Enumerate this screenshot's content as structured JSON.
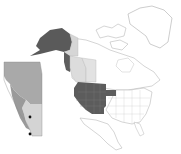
{
  "map": {
    "title": "",
    "background": "#ffffff",
    "outline_color": "#b8b8b8",
    "regions": {
      "alaska": {
        "fill": "#5a5a5a",
        "label": ""
      },
      "yukon_bc_coast": {
        "fill": "#5e5e5e",
        "label": ""
      },
      "yukon_light": {
        "fill": "#d6d6d6",
        "label": ""
      },
      "british_columbia": {
        "fill": "#dcdcdc",
        "label": ""
      },
      "alberta_light": {
        "fill": "#e2e2e2",
        "label": ""
      },
      "western_us": {
        "fill": "#5c5c5c",
        "label": ""
      },
      "nebraska_extension": {
        "fill": "#5c5c5c",
        "label": ""
      }
    },
    "inset": {
      "name": "alberta-inset",
      "fill_north": "#a9a9a9",
      "fill_south": "#d4d4d4",
      "border": "#8a8a8a",
      "points": [
        {
          "x": 30,
          "y": 117,
          "color": "#111111"
        },
        {
          "x": 30,
          "y": 134,
          "color": "#111111"
        }
      ]
    }
  }
}
